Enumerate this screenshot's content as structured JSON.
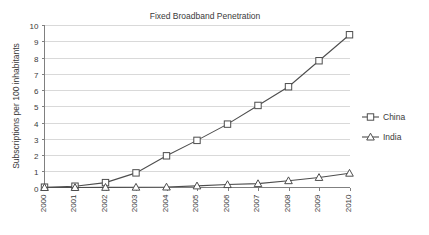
{
  "chart_data": {
    "type": "line",
    "title": "Fixed Broadband Penetration",
    "xlabel": "",
    "ylabel": "Subscriptions per 100 inhabitants",
    "categories": [
      "2000",
      "2001",
      "2002",
      "2003",
      "2004",
      "2005",
      "2006",
      "2007",
      "2008",
      "2009",
      "2010"
    ],
    "ylim": [
      0,
      10
    ],
    "ytick_step": 1,
    "yticks": [
      "0",
      "1",
      "2",
      "3",
      "4",
      "5",
      "6",
      "7",
      "8",
      "9",
      "10"
    ],
    "grid": "horizontal",
    "legend_position": "right",
    "series": [
      {
        "name": "China",
        "marker": "square",
        "values": [
          0.02,
          0.08,
          0.3,
          0.9,
          1.95,
          2.9,
          3.9,
          5.05,
          6.2,
          7.8,
          9.4
        ]
      },
      {
        "name": "India",
        "marker": "triangle",
        "values": [
          0.0,
          0.0,
          0.01,
          0.02,
          0.03,
          0.1,
          0.18,
          0.24,
          0.42,
          0.62,
          0.88
        ]
      }
    ]
  },
  "legend": {
    "items": [
      {
        "label": "China"
      },
      {
        "label": "India"
      }
    ]
  },
  "colors": {
    "series_stroke": "#4d4d4d",
    "grid": "#d9d9d9",
    "axis": "#808080",
    "text": "#3a3a3a",
    "background": "#ffffff"
  }
}
